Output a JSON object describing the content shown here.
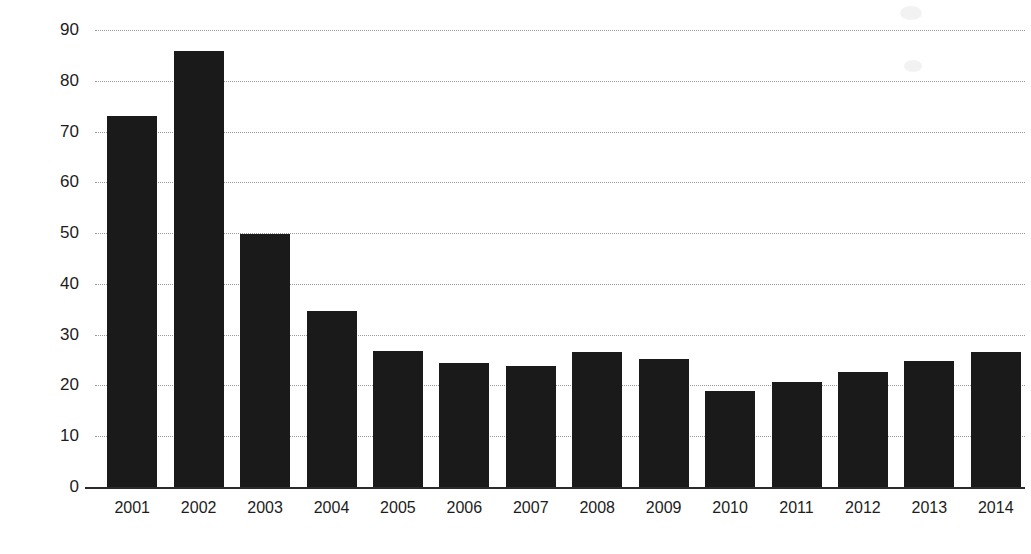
{
  "chart_data": {
    "type": "bar",
    "title": "",
    "subtitle": "",
    "xlabel": "",
    "ylabel": "Thousands",
    "categories": [
      "2001",
      "2002",
      "2003",
      "2004",
      "2005",
      "2006",
      "2007",
      "2008",
      "2009",
      "2010",
      "2011",
      "2012",
      "2013",
      "2014"
    ],
    "values": [
      73.0,
      85.8,
      49.8,
      34.6,
      26.7,
      24.5,
      23.9,
      26.6,
      25.3,
      18.9,
      20.6,
      22.6,
      24.9,
      26.6
    ],
    "series": [
      {
        "name": "Thousands",
        "values": [
          73.0,
          85.8,
          49.8,
          34.6,
          26.7,
          24.5,
          23.9,
          26.6,
          25.3,
          18.9,
          20.6,
          22.6,
          24.9,
          26.6
        ]
      }
    ],
    "ytick_labels": [
      "90",
      "80",
      "70",
      "60",
      "50",
      "40",
      "30",
      "20",
      "10",
      "0"
    ],
    "ytick_values": [
      90,
      80,
      70,
      60,
      50,
      40,
      30,
      20,
      10,
      0
    ],
    "ylim": [
      0,
      90
    ],
    "grid": "horizontal-dotted",
    "legend": "none",
    "legend_position": "",
    "bar_color": "#1a1a1a",
    "grid_color": "#9a9a9a",
    "axis_color": "#2b2b2b",
    "background_color": "#ffffff",
    "annotations": []
  }
}
